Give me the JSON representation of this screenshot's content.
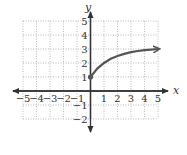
{
  "chart_data": {
    "type": "line",
    "title": "",
    "xlabel": "x",
    "ylabel": "y",
    "xlim": [
      -5,
      5
    ],
    "ylim": [
      -2,
      5
    ],
    "grid": true,
    "x_ticks": [
      "-5",
      "-4",
      "-3",
      "-2",
      "-1",
      "1",
      "2",
      "3",
      "4",
      "5"
    ],
    "y_ticks": [
      "5",
      "4",
      "3",
      "2",
      "1",
      "-1",
      "-2"
    ],
    "series": [
      {
        "name": "curve",
        "start_point": {
          "x": 0,
          "y": 1,
          "marker": "closed-dot"
        },
        "end": "arrow",
        "x": [
          0,
          0.5,
          1,
          1.5,
          2,
          2.5,
          3,
          3.5,
          4,
          4.5,
          5
        ],
        "y": [
          1,
          1.6,
          2.0,
          2.3,
          2.5,
          2.65,
          2.78,
          2.86,
          2.92,
          2.96,
          3.0
        ]
      }
    ],
    "colors": {
      "curve": "#555555",
      "axes": "#333333",
      "grid": "#aaaaaa"
    }
  }
}
